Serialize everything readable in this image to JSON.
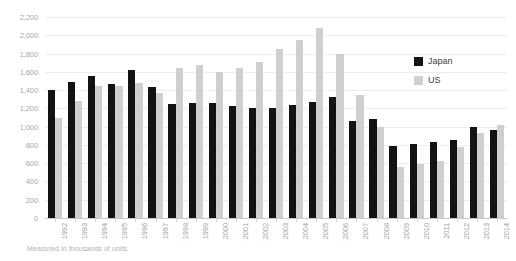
{
  "chart_data": {
    "type": "bar",
    "title": "",
    "subtitle": "",
    "xlabel": "",
    "ylabel": "",
    "ylim": [
      0,
      2200
    ],
    "ytick_step": 200,
    "ytick_labels": [
      "0",
      "200",
      "400",
      "600",
      "800",
      "1,000",
      "1,200",
      "1,400",
      "1,600",
      "1,800",
      "2,000",
      "2,200"
    ],
    "grid": true,
    "legend_position": "right",
    "categories": [
      "1992",
      "1993",
      "1994",
      "1995",
      "1996",
      "1997",
      "1998",
      "1999",
      "2000",
      "2001",
      "2002",
      "2003",
      "2004",
      "2005",
      "2006",
      "2007",
      "2008",
      "2009",
      "2010",
      "2011",
      "2012",
      "2013",
      "2014"
    ],
    "series": [
      {
        "name": "Japan",
        "color": "#131313",
        "values": [
          1400,
          1490,
          1550,
          1470,
          1620,
          1430,
          1250,
          1255,
          1260,
          1230,
          1200,
          1205,
          1235,
          1270,
          1320,
          1060,
          1080,
          790,
          810,
          830,
          850,
          1000,
          960
        ]
      },
      {
        "name": "US",
        "color": "#cfcfcf",
        "values": [
          1090,
          1280,
          1440,
          1450,
          1480,
          1370,
          1640,
          1670,
          1595,
          1640,
          1710,
          1850,
          1950,
          2080,
          1800,
          1350,
          1000,
          560,
          590,
          620,
          780,
          930,
          1020
        ]
      }
    ],
    "annotation": "Measured in thousands of units"
  },
  "legend": {
    "items": [
      {
        "label": "Japan",
        "color": "#131313"
      },
      {
        "label": "US",
        "color": "#cfcfcf"
      }
    ]
  },
  "footnote": {
    "text": "Measured in thousands of units"
  }
}
